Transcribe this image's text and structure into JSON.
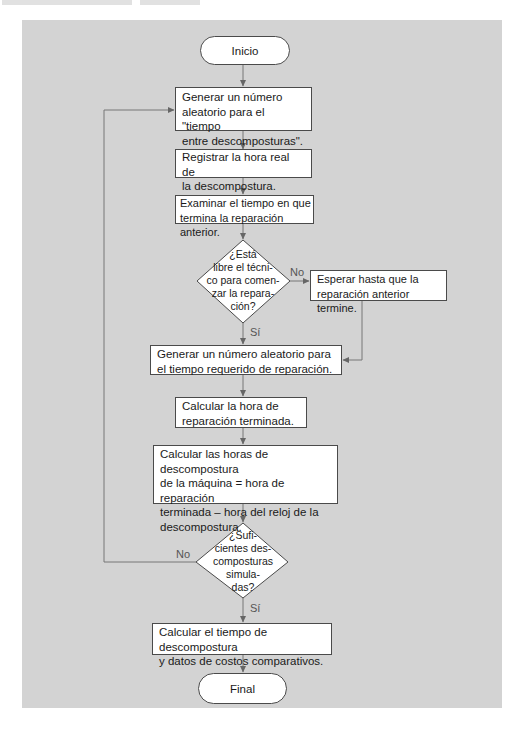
{
  "flowchart": {
    "start": {
      "label": "Inicio"
    },
    "end": {
      "label": "Final"
    },
    "steps": [
      {
        "id": "gen-breakdown",
        "lines": [
          "Generar un número",
          "aleatorio para el \"tiempo",
          "entre descomposturas\"."
        ]
      },
      {
        "id": "record-time",
        "lines": [
          "Registrar la hora real de",
          "la descompostura."
        ]
      },
      {
        "id": "examine-time",
        "lines": [
          "Examinar el tiempo en que",
          "termina la reparación anterior."
        ]
      },
      {
        "id": "wait",
        "lines": [
          "Esperar hasta que la",
          "reparación anterior termine."
        ]
      },
      {
        "id": "gen-repair",
        "lines": [
          "Generar un número aleatorio  para",
          "el tiempo requerido de reparación."
        ]
      },
      {
        "id": "calc-finish",
        "lines": [
          "Calcular la hora de",
          "reparación terminada."
        ]
      },
      {
        "id": "calc-downtime",
        "lines": [
          "Calcular las horas de descompostura",
          "de la máquina = hora de reparación",
          "terminada – hora del reloj de la",
          "descompostura."
        ]
      },
      {
        "id": "calc-costs",
        "lines": [
          "Calcular el tiempo de descompostura",
          "y datos de costos comparativos."
        ]
      }
    ],
    "decisions": [
      {
        "id": "technician-free",
        "lines": [
          "¿Está",
          "libre el técni-",
          "co para comen-",
          "zar la repara-",
          "ción?"
        ],
        "yes_label": "Sí",
        "no_label": "No"
      },
      {
        "id": "enough-breakdowns",
        "lines": [
          "¿Sufi-",
          "cientes des-",
          "composturas",
          "simula-",
          "das?"
        ],
        "yes_label": "Sí",
        "no_label": "No"
      }
    ]
  },
  "colors": {
    "panel": "#d3d3d3",
    "box_fill": "#ffffff",
    "stroke": "#4a4a4a",
    "arrow": "#666666"
  }
}
